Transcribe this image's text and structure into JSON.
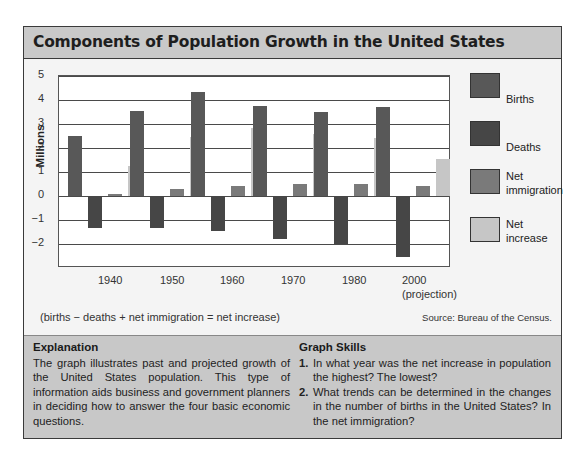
{
  "title": "Components of Population Growth in the United States",
  "chart_data": {
    "type": "bar",
    "title": "Components of Population Growth in the United States",
    "xlabel": "",
    "ylabel": "Millions",
    "ylim": [
      -3,
      5
    ],
    "yticks": [
      5,
      4,
      3,
      2,
      1,
      0,
      -1,
      -2
    ],
    "grid": true,
    "legend_position": "right",
    "categories": [
      "1940",
      "1950",
      "1960",
      "1970",
      "1980",
      "2000 (projection)"
    ],
    "series": [
      {
        "name": "Births",
        "color": "#585858",
        "values": [
          2.5,
          3.55,
          4.35,
          3.75,
          3.5,
          3.7
        ]
      },
      {
        "name": "Deaths",
        "color": "#464646",
        "values": [
          -1.35,
          -1.35,
          -1.45,
          -1.8,
          -2.0,
          -2.55
        ]
      },
      {
        "name": "Net immigration",
        "color": "#7a7a7a",
        "values": [
          0.1,
          0.3,
          0.4,
          0.5,
          0.5,
          0.4
        ]
      },
      {
        "name": "Net increase",
        "color": "#c6c6c6",
        "values": [
          1.25,
          2.45,
          2.85,
          2.6,
          2.4,
          1.55
        ]
      }
    ],
    "annotations": [
      "(births − deaths + net immigration = net increase)",
      "Source: Bureau of the Census."
    ]
  },
  "axis": {
    "ylabel": "Millions",
    "yticks": [
      "5",
      "4",
      "3",
      "2",
      "1",
      "0",
      "−1",
      "−2"
    ],
    "xticks": [
      {
        "line1": "1940",
        "line2": ""
      },
      {
        "line1": "1950",
        "line2": ""
      },
      {
        "line1": "1960",
        "line2": ""
      },
      {
        "line1": "1970",
        "line2": ""
      },
      {
        "line1": "1980",
        "line2": ""
      },
      {
        "line1": "2000",
        "line2": "(projection)"
      }
    ]
  },
  "legend": [
    {
      "label_line1": "Births",
      "label_line2": ""
    },
    {
      "label_line1": "Deaths",
      "label_line2": ""
    },
    {
      "label_line1": "Net",
      "label_line2": "immigration"
    },
    {
      "label_line1": "Net",
      "label_line2": "increase"
    }
  ],
  "formula": "(births − deaths + net immigration = net increase)",
  "source": "Source: Bureau of the Census.",
  "explanation": {
    "heading": "Explanation",
    "text": "The graph illustrates past and projected growth of the United States population. This type of information aids business and government planners in deciding how to answer the four basic economic questions."
  },
  "graph_skills": {
    "heading": "Graph Skills",
    "items": [
      {
        "num": "1.",
        "text": "In what year was the net increase in population the highest? The lowest?"
      },
      {
        "num": "2.",
        "text": "What trends can be determined in the changes in the number of births in the United States? In the net immigration?"
      }
    ]
  }
}
